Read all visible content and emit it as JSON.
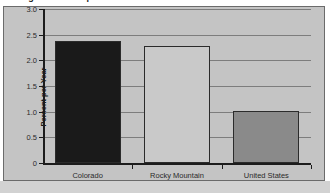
{
  "chart_data": {
    "type": "bar",
    "title": "Average Annual Population",
    "xlabel": "",
    "ylabel": "Percent per Year",
    "categories": [
      "Colorado",
      "Rocky Mountain",
      "United States"
    ],
    "values": [
      2.38,
      2.27,
      1.02
    ],
    "bar_colors": [
      "#1a1a1a",
      "#c9c9c9",
      "#8a8a8a"
    ],
    "ylim": [
      0,
      3.0
    ],
    "yticks": [
      0,
      0.5,
      1.0,
      1.5,
      2.0,
      2.5,
      3.0
    ],
    "ytick_labels": [
      "0",
      "0.5",
      "1.0",
      "1.5",
      "2.0",
      "2.5",
      "3.0"
    ],
    "grid": true,
    "legend": "none"
  },
  "figure": {
    "plot_background": "#c4c4c4",
    "page_background": "#ffffff",
    "border_color": "#6b6b6b",
    "gridline_color": "#7d7d7d",
    "axis_color": "#1c1c1c"
  }
}
